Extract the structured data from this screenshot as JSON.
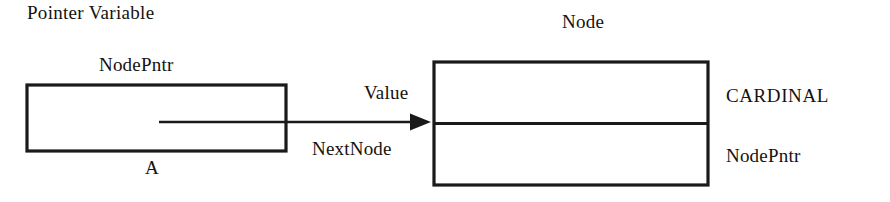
{
  "figure": {
    "type": "pointer-node-diagram",
    "background_color": "#ffffff",
    "stroke_color": "#1a1a1a"
  },
  "headings": {
    "pointer_variable": "Pointer Variable",
    "node": "Node"
  },
  "pointer_variable_box": {
    "type_label": "NodePntr",
    "name_label": "A"
  },
  "arrow": {
    "top_label": "Value",
    "bottom_label": "NextNode"
  },
  "node_box": {
    "fields": [
      {
        "type_label": "CARDINAL"
      },
      {
        "type_label": "NodePntr"
      }
    ]
  }
}
